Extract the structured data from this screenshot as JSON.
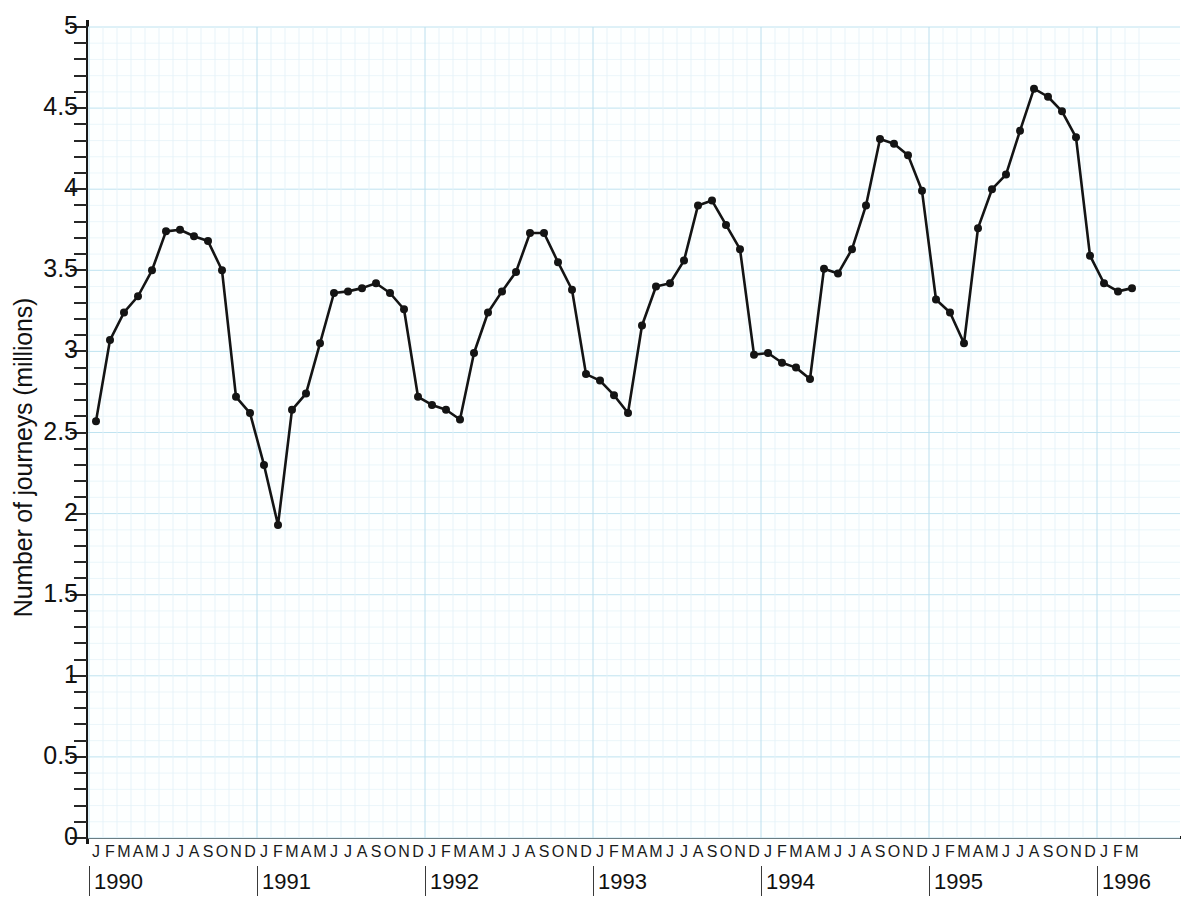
{
  "chart_data": {
    "type": "line",
    "title": "",
    "xlabel": "",
    "ylabel": "Number of journeys (millions)",
    "ylim": [
      0,
      5
    ],
    "ytick_major": [
      0,
      0.5,
      1,
      1.5,
      2,
      2.5,
      3,
      3.5,
      4,
      4.5,
      5
    ],
    "ytick_labels": [
      "0",
      "0.5",
      "1",
      "1.5",
      "2",
      "2.5",
      "3",
      "3.5",
      "4",
      "4.5",
      "5"
    ],
    "ytick_minor_step": 0.1,
    "grid": true,
    "grid_color": "#cfe8f2",
    "legend": "none",
    "line_color": "#141414",
    "marker": "circle",
    "marker_color": "#141414",
    "month_initials": [
      "J",
      "F",
      "M",
      "A",
      "M",
      "J",
      "J",
      "A",
      "S",
      "O",
      "N",
      "D"
    ],
    "years": [
      "1990",
      "1991",
      "1992",
      "1993",
      "1994",
      "1995",
      "1996"
    ],
    "year_month_counts": [
      12,
      12,
      12,
      12,
      12,
      12,
      3
    ],
    "x_start": "1990-01",
    "x_end": "1996-03",
    "categories": [
      "1990-J",
      "1990-F",
      "1990-M",
      "1990-A",
      "1990-M",
      "1990-J",
      "1990-J",
      "1990-A",
      "1990-S",
      "1990-O",
      "1990-N",
      "1990-D",
      "1991-J",
      "1991-F",
      "1991-M",
      "1991-A",
      "1991-M",
      "1991-J",
      "1991-J",
      "1991-A",
      "1991-S",
      "1991-O",
      "1991-N",
      "1991-D",
      "1992-J",
      "1992-F",
      "1992-M",
      "1992-A",
      "1992-M",
      "1992-J",
      "1992-J",
      "1992-A",
      "1992-S",
      "1992-O",
      "1992-N",
      "1992-D",
      "1993-J",
      "1993-F",
      "1993-M",
      "1993-A",
      "1993-M",
      "1993-J",
      "1993-J",
      "1993-A",
      "1993-S",
      "1993-O",
      "1993-N",
      "1993-D",
      "1994-J",
      "1994-F",
      "1994-M",
      "1994-A",
      "1994-M",
      "1994-J",
      "1994-J",
      "1994-A",
      "1994-S",
      "1994-O",
      "1994-N",
      "1994-D",
      "1995-J",
      "1995-F",
      "1995-M",
      "1995-A",
      "1995-M",
      "1995-J",
      "1995-J",
      "1995-A",
      "1995-S",
      "1995-O",
      "1995-N",
      "1995-D",
      "1996-J",
      "1996-F",
      "1996-M"
    ],
    "values": [
      2.57,
      3.07,
      3.24,
      3.34,
      3.5,
      3.74,
      3.75,
      3.71,
      3.68,
      3.5,
      2.72,
      2.62,
      2.3,
      1.93,
      2.64,
      2.74,
      3.05,
      3.36,
      3.37,
      3.39,
      3.42,
      3.36,
      3.26,
      2.72,
      2.67,
      2.64,
      2.58,
      2.99,
      3.24,
      3.37,
      3.49,
      3.73,
      3.73,
      3.55,
      3.38,
      2.86,
      2.82,
      2.73,
      2.62,
      3.16,
      3.4,
      3.42,
      3.56,
      3.9,
      3.93,
      3.78,
      3.63,
      2.98,
      2.99,
      2.93,
      2.9,
      2.83,
      3.51,
      3.48,
      3.63,
      3.9,
      4.31,
      4.28,
      4.21,
      3.99,
      3.32,
      3.24,
      3.05,
      3.76,
      4.0,
      4.09,
      4.36,
      4.62,
      4.57,
      4.48,
      4.32,
      3.59,
      3.42,
      3.37,
      3.39
    ]
  }
}
